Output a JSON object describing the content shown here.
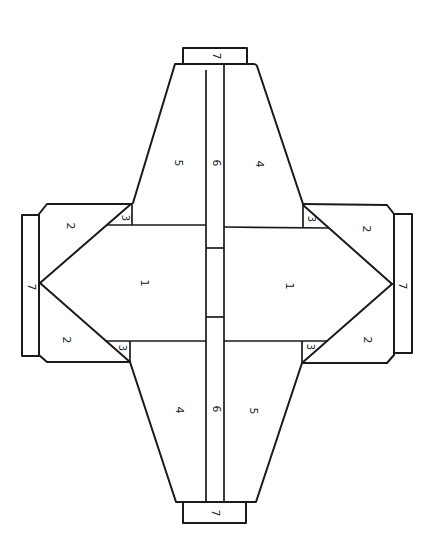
{
  "diagram": {
    "type": "flat-pattern",
    "stroke_color": "#1a1a1a",
    "background_color": "#ffffff",
    "labels": {
      "top_tab": "7",
      "top_left_panel": "5",
      "top_strip": "6",
      "top_right_panel": "4",
      "left_upper_flap": "2",
      "left_lower_flap": "2",
      "left_upper_triangle": "3",
      "left_lower_triangle": "3",
      "left_tab": "7",
      "left_center": "1",
      "right_center": "1",
      "right_upper_triangle": "3",
      "right_lower_triangle": "3",
      "right_upper_flap": "2",
      "right_lower_flap": "2",
      "right_tab": "7",
      "bottom_left_panel": "4",
      "bottom_strip": "6",
      "bottom_right_panel": "5",
      "bottom_tab": "7"
    }
  }
}
